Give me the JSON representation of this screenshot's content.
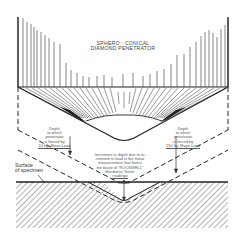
{
  "diagram": {
    "title_line1": "SPHERO - CONICAL",
    "title_line2": "DIAMOND PENETRATOR",
    "left_note": {
      "line1": "Depth",
      "line2": "to which",
      "line3": "penetrator",
      "line4": "is forced by",
      "line5": "10 kg. Minor Load"
    },
    "right_note": {
      "line1": "Depth",
      "line2": "to which",
      "line3": "penetrator",
      "line4": "is forced by",
      "line5": "150 kg. Major Load"
    },
    "center_note": {
      "line1": "Increment in depth due to in-",
      "line2": "crement in load is the linear",
      "line3": "measurement that forms",
      "line4": "the basis of \"ROCKWELL\"",
      "line5": "Hardness Tester",
      "line6": "readings"
    },
    "surface_label_line1": "Surface",
    "surface_label_line2": "of specimen",
    "colors": {
      "line": "#222222",
      "hatch": "#555555",
      "background": "#ffffff"
    }
  }
}
